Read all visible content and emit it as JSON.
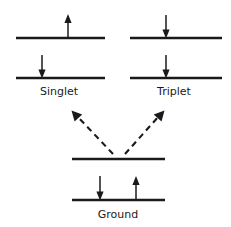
{
  "figure": {
    "kind": "jablonski-energy-level-diagram",
    "background_color": "#ffffff",
    "ink_color": "#1a1a1a",
    "width": 231,
    "height": 227
  },
  "labels": {
    "singlet": "Singlet",
    "triplet": "Triplet",
    "ground": "Ground"
  },
  "label_positions": {
    "singlet": {
      "x": 59,
      "y": 95
    },
    "triplet": {
      "x": 174,
      "y": 95
    },
    "ground": {
      "x": 118,
      "y": 218
    }
  },
  "levels": [
    {
      "name": "singlet-upper-level",
      "x1": 16,
      "x2": 105,
      "y": 38
    },
    {
      "name": "singlet-lower-level",
      "x1": 16,
      "x2": 105,
      "y": 78
    },
    {
      "name": "triplet-upper-level",
      "x1": 130,
      "x2": 222,
      "y": 38
    },
    {
      "name": "triplet-lower-level",
      "x1": 130,
      "x2": 222,
      "y": 78
    },
    {
      "name": "ground-upper-level",
      "x1": 72,
      "x2": 165,
      "y": 159
    },
    {
      "name": "ground-lower-level",
      "x1": 72,
      "x2": 165,
      "y": 200
    }
  ],
  "spin_arrows": [
    {
      "name": "singlet-upper-spin-up",
      "x": 68,
      "direction": "up",
      "tip_y": 15,
      "tail_y": 38
    },
    {
      "name": "singlet-lower-spin-down",
      "x": 42,
      "direction": "down",
      "tip_y": 78,
      "tail_y": 55
    },
    {
      "name": "triplet-upper-spin-down",
      "x": 166,
      "direction": "down",
      "tip_y": 38,
      "tail_y": 15
    },
    {
      "name": "triplet-lower-spin-down",
      "x": 166,
      "direction": "down",
      "tip_y": 78,
      "tail_y": 55
    },
    {
      "name": "ground-spin-down",
      "x": 100,
      "direction": "down",
      "tip_y": 200,
      "tail_y": 176
    },
    {
      "name": "ground-spin-up",
      "x": 136,
      "direction": "up",
      "tip_y": 176,
      "tail_y": 200
    }
  ],
  "excitation_arrows": [
    {
      "name": "excitation-arrow-to-singlet",
      "from": {
        "x": 113,
        "y": 154
      },
      "to": {
        "x": 72,
        "y": 111
      },
      "style": "dashed",
      "head": "at-to"
    },
    {
      "name": "excitation-arrow-to-triplet",
      "from": {
        "x": 125,
        "y": 154
      },
      "to": {
        "x": 164,
        "y": 111
      },
      "style": "dashed",
      "head": "at-to"
    }
  ]
}
